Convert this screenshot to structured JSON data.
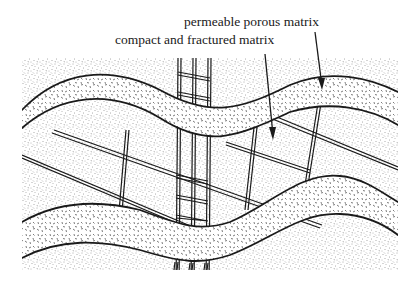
{
  "figure": {
    "labels": {
      "porous": "permeable porous matrix",
      "fractured": "compact and fractured matrix"
    },
    "legend_items": [
      {
        "id": "porous",
        "pattern": "coarse-dashes",
        "description": "permeable porous matrix"
      },
      {
        "id": "fractured",
        "pattern": "fine-stipple-with-fractures",
        "description": "compact and fractured matrix"
      }
    ],
    "colors": {
      "ink": "#1a1a1a",
      "background": "#ffffff"
    }
  }
}
